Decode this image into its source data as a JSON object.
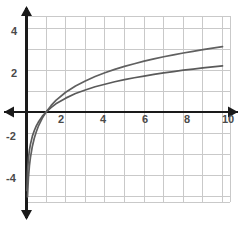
{
  "chart_data": {
    "type": "line",
    "title": "",
    "subtitle": "",
    "xlabel": "",
    "ylabel": "",
    "xlim": [
      -0.4,
      10.5
    ],
    "ylim": [
      -4.6,
      4.6
    ],
    "grid": true,
    "grid_step_x": 1,
    "grid_step_y": 1,
    "legend_position": "none",
    "x_ticks": [
      2,
      4,
      6,
      8,
      10
    ],
    "x_tick_labels": [
      "2",
      "4",
      "6",
      "8",
      "10"
    ],
    "y_ticks": [
      4,
      2,
      -2,
      -4
    ],
    "y_tick_labels": [
      "4",
      "2",
      "-2",
      "-4"
    ],
    "series": [
      {
        "name": "upper-log-curve",
        "color": "#606060",
        "description": "y = 1.35 * ln(x)",
        "x": [
          0.02,
          0.05,
          0.1,
          0.15,
          0.2,
          0.3,
          0.4,
          0.5,
          0.6,
          0.8,
          1.0,
          1.25,
          1.5,
          2.0,
          2.5,
          3.0,
          3.5,
          4.0,
          4.5,
          5.0,
          5.5,
          6.0,
          6.5,
          7.0,
          7.5,
          8.0,
          8.5,
          9.0,
          9.5,
          10.0
        ],
        "y": [
          -5.28,
          -4.04,
          -3.11,
          -2.56,
          -2.17,
          -1.63,
          -1.24,
          -0.94,
          -0.69,
          -0.3,
          0.0,
          0.3,
          0.55,
          0.94,
          1.24,
          1.48,
          1.69,
          1.87,
          2.03,
          2.17,
          2.3,
          2.42,
          2.53,
          2.63,
          2.72,
          2.81,
          2.89,
          2.97,
          3.04,
          3.11
        ]
      },
      {
        "name": "lower-log-curve",
        "color": "#5a5a5a",
        "description": "y = 0.955 * ln(x)",
        "x": [
          0.02,
          0.05,
          0.1,
          0.15,
          0.2,
          0.3,
          0.4,
          0.5,
          0.6,
          0.8,
          1.0,
          1.25,
          1.5,
          2.0,
          2.5,
          3.0,
          3.5,
          4.0,
          4.5,
          5.0,
          5.5,
          6.0,
          6.5,
          7.0,
          7.5,
          8.0,
          8.5,
          9.0,
          9.5,
          10.0
        ],
        "y": [
          -3.74,
          -2.86,
          -2.2,
          -1.81,
          -1.54,
          -1.15,
          -0.88,
          -0.66,
          -0.49,
          -0.21,
          0.0,
          0.21,
          0.39,
          0.66,
          0.88,
          1.05,
          1.2,
          1.32,
          1.44,
          1.54,
          1.63,
          1.71,
          1.79,
          1.86,
          1.92,
          1.99,
          2.04,
          2.1,
          2.15,
          2.2
        ]
      }
    ],
    "annotations": [],
    "colors": {
      "background": "#ffffff",
      "grid": "#c9c9c9",
      "axis": "#1a1a1a",
      "tick_text": "#4a4a4a",
      "curve_upper": "#606060",
      "curve_lower": "#5a5a5a"
    },
    "axis_arrows": {
      "x_left": true,
      "x_right": true,
      "y_top": true,
      "y_bottom": true
    }
  }
}
